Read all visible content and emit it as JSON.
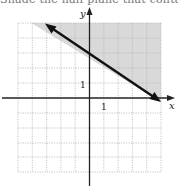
{
  "caption": "Shade the half-plane that containing",
  "graph": {
    "x_axis_label": "x",
    "y_axis_label": "y",
    "x_tick_label": "1",
    "y_tick_label": "1",
    "x_range": [
      -5,
      5
    ],
    "y_range": [
      -5,
      5
    ],
    "boundary_line": {
      "equation": "y = -2/3 x + 3",
      "style": "solid",
      "arrows": "both",
      "from": [
        -3,
        5
      ],
      "to": [
        4.8,
        -0.2
      ]
    },
    "shaded_region": "above the line (y >= -2/3 x + 3)",
    "colors": {
      "shade": "#d9d9d9",
      "grid": "#b8b8b8",
      "axis": "#222222",
      "line": "#111111"
    }
  }
}
